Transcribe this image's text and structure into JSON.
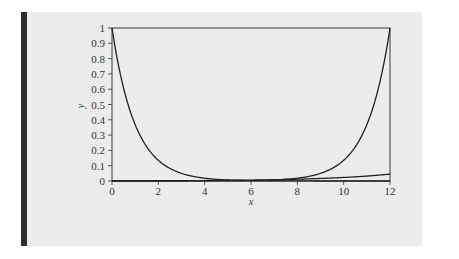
{
  "chart_data": {
    "type": "line",
    "title": "",
    "xlabel": "x",
    "ylabel": "y",
    "xlim": [
      0,
      12
    ],
    "ylim": [
      0,
      1
    ],
    "x_ticks": [
      "0",
      "2",
      "4",
      "6",
      "8",
      "10",
      "12"
    ],
    "y_ticks": [
      "0",
      "0.1",
      "0.2",
      "0.3",
      "0.4",
      "0.5",
      "0.6",
      "0.7",
      "0.8",
      "0.9",
      "1"
    ],
    "grid": false,
    "legend": null,
    "series": [
      {
        "name": "decaying",
        "x": [
          0,
          1,
          2,
          3,
          4,
          5,
          6,
          7,
          8,
          9,
          10,
          11,
          12
        ],
        "values": [
          1.0,
          0.368,
          0.135,
          0.05,
          0.018,
          0.007,
          0.002,
          0.001,
          0.0,
          0.0,
          0.0,
          0.0,
          0.0
        ]
      },
      {
        "name": "rising",
        "x": [
          0,
          1,
          2,
          3,
          4,
          5,
          6,
          7,
          8,
          9,
          10,
          11,
          12
        ],
        "values": [
          0.0,
          0.0,
          0.0,
          0.0,
          0.0,
          0.001,
          0.002,
          0.007,
          0.018,
          0.05,
          0.135,
          0.368,
          1.0
        ]
      },
      {
        "name": "slow-rising",
        "x": [
          0,
          2,
          4,
          6,
          8,
          10,
          12
        ],
        "values": [
          0.001,
          0.002,
          0.003,
          0.006,
          0.012,
          0.023,
          0.045
        ]
      }
    ],
    "colors": {
      "line": "#222222",
      "axis": "#555555",
      "background": "#ececec",
      "accent_bar": "#2e2e2e"
    }
  }
}
